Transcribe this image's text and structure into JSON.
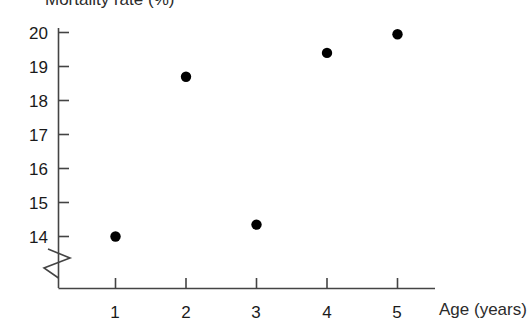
{
  "chart_data": {
    "type": "scatter",
    "title": "",
    "xlabel": "Age (years)",
    "ylabel": "Mortality rate (%)",
    "x": [
      1,
      2,
      3,
      4,
      5
    ],
    "values": [
      14.0,
      18.7,
      14.35,
      19.4,
      19.95
    ],
    "xticks": [
      "1",
      "2",
      "3",
      "4",
      "5"
    ],
    "yticks": [
      "20",
      "19",
      "18",
      "17",
      "16",
      "15",
      "14"
    ],
    "xlim": [
      0.5,
      5.55
    ],
    "ylim": [
      13.85,
      20.15
    ],
    "grid": false,
    "legend": null,
    "axis_break": "y-axis break below 14",
    "marker_color": "#000000",
    "axis_color": "#444444"
  },
  "axes": {
    "y_title": "Mortality rate (%)",
    "x_title": "Age (years)"
  },
  "y_tick_labels": [
    "20",
    "19",
    "18",
    "17",
    "16",
    "15",
    "14"
  ],
  "x_tick_labels": [
    "1",
    "2",
    "3",
    "4",
    "5"
  ]
}
